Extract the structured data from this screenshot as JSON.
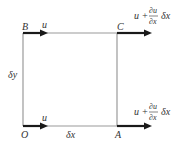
{
  "diagram": {
    "corners": {
      "O": "O",
      "A": "A",
      "B": "B",
      "C": "C"
    },
    "dimensions": {
      "horizontal": "δx",
      "vertical": "δy"
    },
    "velocities": {
      "left_top": "u",
      "left_bottom": "u",
      "right_top": {
        "base": "u +",
        "numerator": "∂u",
        "denominator": "∂x",
        "tail": "δx"
      },
      "right_bottom": {
        "base": "u +",
        "numerator": "∂u",
        "denominator": "∂x",
        "tail": "δx"
      }
    },
    "colors": {
      "edge": "#9a9a9a",
      "arrow": "#1a1a1a",
      "text": "#333333"
    }
  }
}
